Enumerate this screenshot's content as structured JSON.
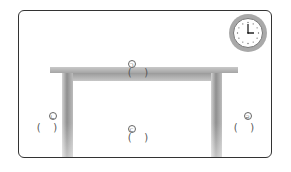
{
  "diagram": {
    "type": "table-parts-worksheet",
    "labels": [
      {
        "id": "a",
        "mark": "ㄱ",
        "blank": "(    )",
        "position": "above tabletop"
      },
      {
        "id": "b",
        "mark": "ㄴ",
        "blank": "(    )",
        "position": "left of left leg"
      },
      {
        "id": "c",
        "mark": "ㄷ",
        "blank": "(    )",
        "position": "under table, center"
      },
      {
        "id": "d",
        "mark": "ㄹ",
        "blank": "(    )",
        "position": "right of right leg"
      }
    ],
    "clock": {
      "time": "3:00",
      "hour_hand_angle_deg": 90,
      "minute_hand_angle_deg": 0
    }
  },
  "colors": {
    "frame": "#333333",
    "table": "#a5a5a5",
    "clock_rim": "#a9a9a9",
    "text": "#555555"
  }
}
